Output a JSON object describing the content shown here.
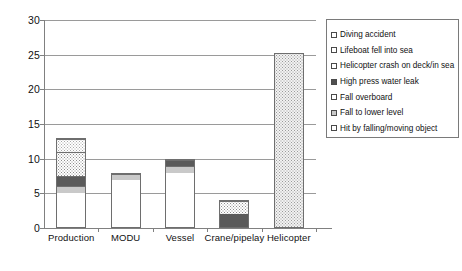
{
  "chart_data": {
    "type": "bar",
    "stacked": true,
    "title": "",
    "xlabel": "",
    "ylabel": "",
    "ylim": [
      0,
      30
    ],
    "ytick_step": 5,
    "yticks": [
      "0",
      "5",
      "10",
      "15",
      "20",
      "25",
      "30"
    ],
    "grid": true,
    "legend_position": "right",
    "categories": [
      "Production",
      "MODU",
      "Vessel",
      "Crane/pipelay",
      "Helicopter"
    ],
    "series": [
      {
        "name": "Hit by falling/moving object",
        "swatch": "white",
        "values": [
          5,
          7,
          8,
          0,
          0
        ]
      },
      {
        "name": "Fall to lower level",
        "swatch": "ltgray",
        "values": [
          1,
          1,
          1,
          0,
          0
        ]
      },
      {
        "name": "Fall overboard",
        "swatch": "dark",
        "values": [
          1.5,
          0,
          1,
          0,
          0
        ]
      },
      {
        "name": "High press water leak",
        "swatch": "dark",
        "values": [
          0,
          0,
          0,
          2,
          0
        ]
      },
      {
        "name": "Helicopter crash on deck/in sea",
        "swatch": "dot-light",
        "values": [
          0,
          0,
          0,
          0,
          25.3
        ]
      },
      {
        "name": "Lifeboat fell into sea",
        "swatch": "dot-med",
        "values": [
          3.5,
          0,
          0,
          2,
          0
        ]
      },
      {
        "name": "Diving accident",
        "swatch": "dot-light",
        "values": [
          2,
          0,
          0,
          0,
          0
        ]
      }
    ],
    "totals": [
      13,
      8,
      10,
      4,
      25.3
    ],
    "bars": [
      {
        "category": "Production",
        "total": 13,
        "segments": [
          {
            "label": "Hit by falling/moving object",
            "value": 5,
            "fill": "f-white"
          },
          {
            "label": "Fall to lower level",
            "value": 1,
            "fill": "f-ltgray"
          },
          {
            "label": "Fall overboard",
            "value": 1.5,
            "fill": "f-dark"
          },
          {
            "label": "Lifeboat fell into sea",
            "value": 3.5,
            "fill": "f-dot-med"
          },
          {
            "label": "Diving accident",
            "value": 2,
            "fill": "f-dot-light"
          }
        ]
      },
      {
        "category": "MODU",
        "total": 8,
        "segments": [
          {
            "label": "Hit by falling/moving object",
            "value": 7,
            "fill": "f-white"
          },
          {
            "label": "Fall to lower level",
            "value": 1,
            "fill": "f-ltgray"
          }
        ]
      },
      {
        "category": "Vessel",
        "total": 10,
        "segments": [
          {
            "label": "Hit by falling/moving object",
            "value": 8,
            "fill": "f-white"
          },
          {
            "label": "Fall to lower level",
            "value": 1,
            "fill": "f-ltgray"
          },
          {
            "label": "Fall overboard",
            "value": 1,
            "fill": "f-dark"
          }
        ]
      },
      {
        "category": "Crane/pipelay",
        "total": 4,
        "segments": [
          {
            "label": "High press water leak",
            "value": 2,
            "fill": "f-dark"
          },
          {
            "label": "Lifeboat fell into sea",
            "value": 2,
            "fill": "f-dot-med"
          }
        ]
      },
      {
        "category": "Helicopter",
        "total": 25.3,
        "segments": [
          {
            "label": "Helicopter crash on deck/in sea",
            "value": 25.3,
            "fill": "f-dot-heli"
          }
        ]
      }
    ]
  },
  "legend": {
    "items": [
      {
        "label": "Diving accident",
        "swatch_class": "sw-dot-light"
      },
      {
        "label": "Lifeboat fell into sea",
        "swatch_class": "sw-dot-light"
      },
      {
        "label": "Helicopter crash on deck/in sea",
        "swatch_class": "sw-dot-light"
      },
      {
        "label": "High press water leak",
        "swatch_class": "sw-dark"
      },
      {
        "label": "Fall overboard",
        "swatch_class": "sw-dot-med"
      },
      {
        "label": "Fall to lower level",
        "swatch_class": "sw-ltgray"
      },
      {
        "label": "Hit by falling/moving object",
        "swatch_class": "sw-white"
      }
    ]
  },
  "colors": {
    "axis": "#808080",
    "gridline": "#9a9a9a",
    "bar_border": "#6e6e6e",
    "text": "#111111",
    "background": "#ffffff"
  }
}
